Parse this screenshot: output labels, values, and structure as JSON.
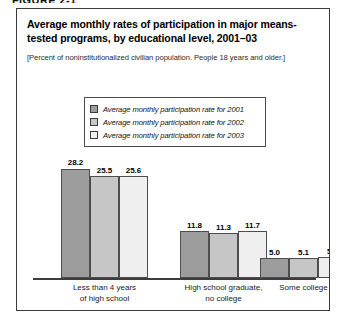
{
  "figure_label": "FIGURE 2-1",
  "title": "Average monthly rates of participation in major means-tested programs, by educational level, 2001–03",
  "subtitle": "[Percent of noninstitutionalized civilian population. People 18 years and older.]",
  "legend": {
    "items": [
      {
        "label": "Average monthly participation rate for 2001",
        "color": "#9d9d9d"
      },
      {
        "label": "Average monthly participation rate for 2002",
        "color": "#c6c6c6"
      },
      {
        "label": "Average monthly participation rate for 2003",
        "color": "#efefef"
      }
    ]
  },
  "chart_data": {
    "type": "bar",
    "title": "Average monthly rates of participation in major means-tested programs, by educational level, 2001–03",
    "subtitle": "[Percent of noninstitutionalized civilian population. People 18 years and older.]",
    "xlabel": "",
    "ylabel": "Percent",
    "ylim": [
      0,
      30
    ],
    "grid": false,
    "legend_position": "top-center",
    "categories": [
      "Less than 4 years of high school",
      "High school graduate, no college",
      "Some college"
    ],
    "category_lines": [
      [
        "Less than 4 years",
        "of high school"
      ],
      [
        "High school graduate,",
        "no college"
      ],
      [
        "Some college"
      ]
    ],
    "series": [
      {
        "name": "Average monthly participation rate for 2001",
        "color": "#9d9d9d",
        "values": [
          28.2,
          11.8,
          5.0
        ]
      },
      {
        "name": "Average monthly participation rate for 2002",
        "color": "#c6c6c6",
        "values": [
          25.5,
          11.3,
          5.1
        ]
      },
      {
        "name": "Average monthly participation rate for 2003",
        "color": "#efefef",
        "values": [
          25.6,
          11.7,
          5.2
        ]
      }
    ],
    "value_labels": [
      [
        "28.2",
        "25.5",
        "25.6"
      ],
      [
        "11.8",
        "11.3",
        "11.7"
      ],
      [
        "5.0",
        "5.1",
        "5.2"
      ]
    ]
  },
  "colors": {
    "panel_border": "#3a3a3a",
    "axis": "#3d3d3d",
    "bar_outline": "#4d4d4d",
    "background": "#ffffff"
  }
}
